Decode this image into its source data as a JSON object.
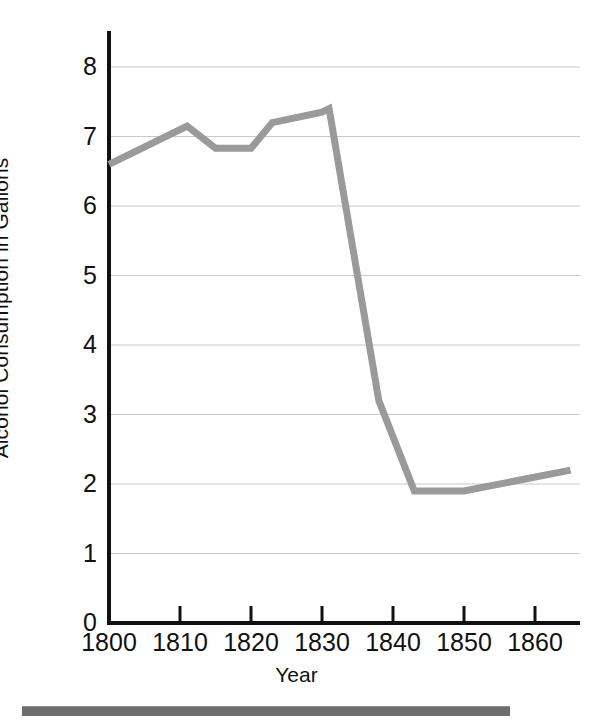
{
  "chart_data": {
    "type": "line",
    "title": "",
    "xlabel": "Year",
    "ylabel": "Alcohol Consumption in Gallons",
    "xlim": [
      1800,
      1866
    ],
    "ylim": [
      0,
      8.6
    ],
    "xticks": [
      1800,
      1810,
      1820,
      1830,
      1840,
      1850,
      1860
    ],
    "xtick_labels": [
      "1800",
      "1810",
      "1820",
      "1830",
      "1840",
      "1850",
      "1860"
    ],
    "yticks": [
      0,
      1,
      2,
      3,
      4,
      5,
      6,
      7,
      8
    ],
    "ytick_labels": [
      "0",
      "1",
      "2",
      "3",
      "4",
      "5",
      "6",
      "7",
      "8"
    ],
    "grid": "horizontal",
    "grid_color": "#c8c8c8",
    "legend": "none",
    "line_color": "#9a9a9a",
    "line_width": 7,
    "axis_color": "#111111",
    "series": [
      {
        "name": "Alcohol Consumption in Gallons",
        "x": [
          1800,
          1811,
          1815,
          1820,
          1823,
          1830,
          1831,
          1838,
          1843,
          1850,
          1865
        ],
        "values": [
          6.6,
          7.15,
          6.83,
          6.83,
          7.2,
          7.35,
          7.4,
          3.2,
          1.9,
          1.9,
          2.2
        ]
      }
    ]
  },
  "figure": {
    "bottom_rule_color": "#6e6e6e"
  }
}
